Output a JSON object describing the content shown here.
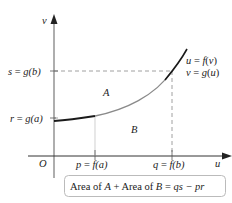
{
  "diagram": {
    "axes": {
      "x_label": "u",
      "y_label": "v",
      "origin_label": "O"
    },
    "y_ticks": [
      {
        "label": "s = g(b)",
        "var": "s",
        "rhs": "g(b)"
      },
      {
        "label": "r = g(a)",
        "var": "r",
        "rhs": "g(a)"
      }
    ],
    "x_ticks": [
      {
        "label": "p = f(a)",
        "var": "p",
        "rhs": "f(a)"
      },
      {
        "label": "q = f(b)",
        "var": "q",
        "rhs": "f(b)"
      }
    ],
    "regions": {
      "a_label": "A",
      "b_label": "B"
    },
    "curve_labels": {
      "line1": "u = f(v)",
      "line2": "v = g(u)"
    },
    "formula_box": {
      "text": "Area of A + Area of B = qs − pr",
      "part1": "Area of ",
      "a": "A",
      "plus": " + Area of ",
      "b": "B",
      "eq": " = ",
      "rhs": "qs − pr"
    },
    "colors": {
      "axis": "#9a9a9a",
      "curve_dark": "#1a1a1a",
      "curve_gray": "#8a8a8a",
      "dashed": "#888888",
      "text": "#222222",
      "box_border": "#bbbbbb"
    }
  }
}
